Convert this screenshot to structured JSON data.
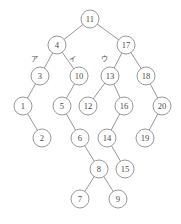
{
  "figure": {
    "background_color": "#ffffff",
    "node_fill": "#ffffff",
    "node_stroke": "#8c8c8c",
    "edge_stroke": "#8c8c8c",
    "text_color": "#4a4a4a",
    "node_radius": 9
  },
  "chart_data": {
    "type": "diagram",
    "diagram_kind": "binary-tree",
    "root": "11",
    "node_values": [
      "11",
      "4",
      "17",
      "3",
      "10",
      "13",
      "18",
      "1",
      "5",
      "12",
      "16",
      "20",
      "2",
      "6",
      "14",
      "19",
      "8",
      "15",
      "7",
      "9"
    ],
    "nodes": [
      {
        "id": "n11",
        "label": "11",
        "x": 90,
        "y": 19,
        "depth": 0
      },
      {
        "id": "n4",
        "label": "4",
        "x": 57,
        "y": 45,
        "depth": 1
      },
      {
        "id": "n17",
        "label": "17",
        "x": 126,
        "y": 45,
        "depth": 1
      },
      {
        "id": "n3",
        "label": "3",
        "x": 40,
        "y": 76,
        "depth": 2
      },
      {
        "id": "n10",
        "label": "10",
        "x": 79,
        "y": 76,
        "depth": 2
      },
      {
        "id": "n13",
        "label": "13",
        "x": 110,
        "y": 76,
        "depth": 2
      },
      {
        "id": "n18",
        "label": "18",
        "x": 146,
        "y": 76,
        "depth": 2
      },
      {
        "id": "n1",
        "label": "1",
        "x": 23,
        "y": 106,
        "depth": 3
      },
      {
        "id": "n5",
        "label": "5",
        "x": 62,
        "y": 106,
        "depth": 3
      },
      {
        "id": "n12",
        "label": "12",
        "x": 88,
        "y": 106,
        "depth": 3
      },
      {
        "id": "n16",
        "label": "16",
        "x": 124,
        "y": 106,
        "depth": 3
      },
      {
        "id": "n20",
        "label": "20",
        "x": 162,
        "y": 106,
        "depth": 3
      },
      {
        "id": "n2",
        "label": "2",
        "x": 42,
        "y": 138,
        "depth": 4
      },
      {
        "id": "n6",
        "label": "6",
        "x": 80,
        "y": 138,
        "depth": 4
      },
      {
        "id": "n14",
        "label": "14",
        "x": 107,
        "y": 138,
        "depth": 4
      },
      {
        "id": "n19",
        "label": "19",
        "x": 145,
        "y": 138,
        "depth": 4
      },
      {
        "id": "n8",
        "label": "8",
        "x": 99,
        "y": 169,
        "depth": 5
      },
      {
        "id": "n15",
        "label": "15",
        "x": 125,
        "y": 169,
        "depth": 5
      },
      {
        "id": "n7",
        "label": "7",
        "x": 80,
        "y": 199,
        "depth": 6
      },
      {
        "id": "n9",
        "label": "9",
        "x": 118,
        "y": 199,
        "depth": 6
      }
    ],
    "edges": [
      {
        "from": "11",
        "to": "4",
        "side": "left"
      },
      {
        "from": "11",
        "to": "17",
        "side": "right"
      },
      {
        "from": "4",
        "to": "3",
        "side": "left"
      },
      {
        "from": "4",
        "to": "10",
        "side": "right"
      },
      {
        "from": "17",
        "to": "13",
        "side": "left"
      },
      {
        "from": "17",
        "to": "18",
        "side": "right"
      },
      {
        "from": "3",
        "to": "1",
        "side": "left"
      },
      {
        "from": "1",
        "to": "2",
        "side": "right"
      },
      {
        "from": "10",
        "to": "5",
        "side": "left"
      },
      {
        "from": "5",
        "to": "6",
        "side": "right"
      },
      {
        "from": "6",
        "to": "8",
        "side": "right"
      },
      {
        "from": "8",
        "to": "7",
        "side": "left"
      },
      {
        "from": "8",
        "to": "9",
        "side": "right"
      },
      {
        "from": "13",
        "to": "12",
        "side": "left"
      },
      {
        "from": "13",
        "to": "16",
        "side": "right"
      },
      {
        "from": "16",
        "to": "14",
        "side": "left"
      },
      {
        "from": "14",
        "to": "15",
        "side": "right"
      },
      {
        "from": "18",
        "to": "20",
        "side": "right"
      },
      {
        "from": "20",
        "to": "19",
        "side": "left"
      }
    ],
    "annotations": [
      {
        "id": "a1",
        "text": "ア",
        "x": 34,
        "y": 58,
        "target_edge": "4-3"
      },
      {
        "id": "a2",
        "text": "イ",
        "x": 72,
        "y": 58,
        "target_edge": "4-10"
      },
      {
        "id": "a3",
        "text": "ウ",
        "x": 104,
        "y": 58,
        "target_edge": "17-13"
      }
    ]
  }
}
